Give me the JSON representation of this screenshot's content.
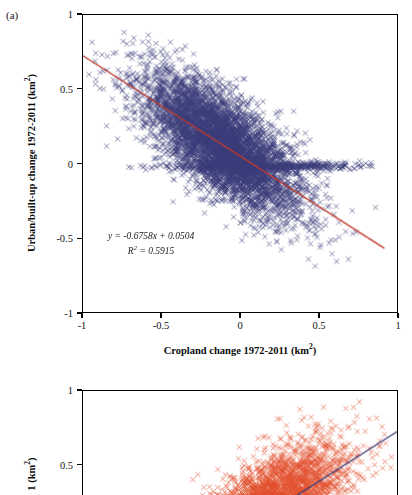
{
  "figure": {
    "width": 412,
    "height": 495,
    "background": "#ffffff"
  },
  "chart_data": [
    {
      "type": "scatter",
      "panel_label": "(a)",
      "title": "",
      "xlabel": "Cropland change 1972-2011 (km²)",
      "ylabel": "Urban/built-up change 1972-2011 (km²)",
      "xlim": [
        -1,
        1
      ],
      "ylim": [
        -1,
        1
      ],
      "xticks": [
        -1,
        -0.5,
        0,
        0.5,
        1
      ],
      "xticklabels": [
        "-1",
        "-0.5",
        "0",
        "0.5",
        "1"
      ],
      "yticks": [
        -1,
        -0.5,
        0,
        0.5,
        1
      ],
      "yticklabels": [
        "-1",
        "-0.5",
        "0",
        "0.5",
        "1"
      ],
      "grid": false,
      "legend": false,
      "marker": "x",
      "marker_color": "#3b3c7a",
      "marker_size": 2.6,
      "point_count": 6000,
      "trendline": {
        "slope": -0.6758,
        "intercept": 0.0504,
        "color": "#c0392b",
        "width": 1.3,
        "x_start": -1.0,
        "x_end": 0.92
      },
      "annotation": {
        "equation": "y = -0.6758x + 0.0504",
        "r_squared": "R² = 0.5915",
        "r_squared_value": 0.5915,
        "slope_text": "-0.6758",
        "intercept_text": "0.0504"
      },
      "scatter_model": {
        "seed": 20110424,
        "x_mean": -0.12,
        "x_sd": 0.255,
        "x_clip": [
          -0.98,
          0.88
        ],
        "resid_sd": 0.165,
        "y_clip": [
          -0.93,
          0.95
        ],
        "tail_fraction": 0.09,
        "tail_y_sd": 0.055,
        "tail_x_shift": 0.3
      }
    },
    {
      "type": "scatter",
      "panel_label": "(b)",
      "title": "",
      "xlabel": "",
      "ylabel": "1 (km²)",
      "xlim": [
        -1,
        1
      ],
      "ylim": [
        -1,
        1
      ],
      "yticks": [
        1,
        0.5
      ],
      "yticklabels": [
        "1",
        "0.5"
      ],
      "grid": false,
      "legend": false,
      "marker": "x",
      "marker_color": "#e2512e",
      "marker_size": 2.6,
      "point_count": 6000,
      "cropped": true,
      "trendline": {
        "slope": 0.6758,
        "intercept": 0.0504,
        "color": "#3b3c7a",
        "width": 1.3,
        "x_start": -0.02,
        "x_end": 1.0
      },
      "scatter_model": {
        "seed": 777321,
        "x_mean": 0.1,
        "x_sd": 0.255,
        "x_clip": [
          -0.75,
          0.98
        ],
        "resid_sd": 0.165,
        "y_clip": [
          -0.93,
          0.95
        ],
        "tail_fraction": 0.05,
        "tail_y_sd": 0.055,
        "tail_x_shift": -0.3
      }
    }
  ]
}
